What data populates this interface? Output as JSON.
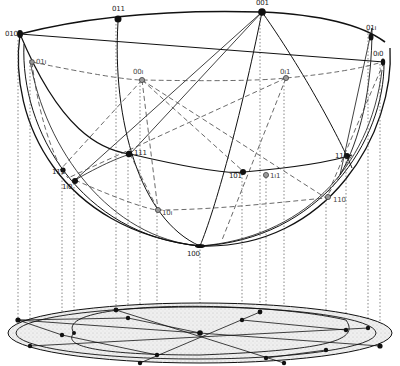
{
  "diagram": {
    "colors": {
      "ink": "#111111",
      "hidden": "#555555",
      "base_fill": "#e6e6e6",
      "background": "#ffffff"
    }
  },
  "labels": {
    "p_010_left": "010",
    "p_011_top": "011",
    "p_001_top": "001",
    "p_011_right": "01ı",
    "p_010_right": "0ı0",
    "p_01b_left": "01ı",
    "p_00b": "00ı",
    "p_0b1": "0ı1",
    "p_111_left": "111",
    "p_1b0_left": "1ı0",
    "p_111_mid": "111",
    "p_101": "101",
    "p_1b1": "1ı1",
    "p_111_right": "111",
    "p_10b": "10ı",
    "p_110": "110",
    "p_100": "100"
  }
}
